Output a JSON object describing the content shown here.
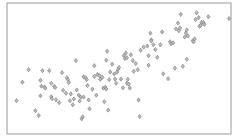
{
  "chart_data": {
    "type": "scatter",
    "title": "",
    "xlabel": "",
    "ylabel": "",
    "xlim": [
      0,
      100
    ],
    "ylim": [
      0,
      100
    ],
    "grid": false,
    "legend": null,
    "marker": "diamond",
    "colors": {
      "marker_fill": "#b9b9b9",
      "marker_edge": "#7d7d7d",
      "frame": "#9a9a9a"
    },
    "points": [
      [
        3.4,
        24.7
      ],
      [
        6.1,
        39.2
      ],
      [
        8.9,
        49.1
      ],
      [
        12.0,
        16.8
      ],
      [
        13.5,
        13.0
      ],
      [
        14.3,
        40.7
      ],
      [
        14.7,
        36.1
      ],
      [
        14.3,
        28.5
      ],
      [
        15.2,
        48.3
      ],
      [
        16.1,
        35.4
      ],
      [
        16.5,
        34.6
      ],
      [
        18.3,
        48.3
      ],
      [
        19.2,
        38.4
      ],
      [
        19.2,
        27.7
      ],
      [
        19.6,
        26.2
      ],
      [
        20.5,
        35.9
      ],
      [
        21.0,
        35.1
      ],
      [
        21.4,
        25.4
      ],
      [
        22.8,
        23.1
      ],
      [
        24.1,
        46.8
      ],
      [
        24.6,
        32.8
      ],
      [
        25.9,
        30.5
      ],
      [
        26.3,
        42.7
      ],
      [
        26.8,
        41.2
      ],
      [
        27.2,
        38.9
      ],
      [
        27.7,
        24.6
      ],
      [
        28.1,
        30.0
      ],
      [
        29.0,
        21.4
      ],
      [
        29.5,
        26.0
      ],
      [
        30.4,
        56.2
      ],
      [
        30.8,
        33.1
      ],
      [
        31.7,
        29.0
      ],
      [
        32.1,
        24.4
      ],
      [
        32.6,
        27.5
      ],
      [
        33.0,
        10.4
      ],
      [
        33.5,
        11.9
      ],
      [
        33.9,
        43.5
      ],
      [
        33.9,
        27.5
      ],
      [
        34.8,
        42.7
      ],
      [
        35.3,
        41.2
      ],
      [
        35.7,
        36.6
      ],
      [
        36.2,
        25.2
      ],
      [
        36.6,
        18.3
      ],
      [
        37.9,
        33.7
      ],
      [
        38.8,
        52.2
      ],
      [
        38.8,
        43.8
      ],
      [
        39.7,
        29.0
      ],
      [
        40.2,
        45.3
      ],
      [
        41.1,
        44.5
      ],
      [
        41.5,
        41.5
      ],
      [
        42.4,
        43.0
      ],
      [
        42.9,
        34.6
      ],
      [
        43.3,
        23.9
      ],
      [
        43.8,
        35.4
      ],
      [
        44.2,
        33.8
      ],
      [
        44.2,
        56.5
      ],
      [
        44.6,
        63.6
      ],
      [
        45.1,
        17.3
      ],
      [
        45.5,
        41.2
      ],
      [
        46.0,
        47.3
      ],
      [
        46.9,
        53.4
      ],
      [
        47.8,
        45.7
      ],
      [
        48.2,
        41.7
      ],
      [
        48.7,
        38.4
      ],
      [
        49.1,
        47.1
      ],
      [
        49.6,
        49.4
      ],
      [
        50.0,
        50.9
      ],
      [
        50.9,
        41.7
      ],
      [
        51.8,
        34.8
      ],
      [
        52.2,
        60.1
      ],
      [
        52.7,
        57.8
      ],
      [
        53.1,
        62.3
      ],
      [
        53.6,
        58.5
      ],
      [
        53.6,
        38.4
      ],
      [
        54.0,
        41.5
      ],
      [
        54.5,
        37.6
      ],
      [
        54.9,
        34.6
      ],
      [
        55.4,
        60.8
      ],
      [
        56.3,
        56.2
      ],
      [
        56.7,
        47.8
      ],
      [
        57.6,
        53.9
      ],
      [
        58.5,
        49.1
      ],
      [
        58.9,
        25.2
      ],
      [
        59.4,
        12.2
      ],
      [
        59.8,
        64.4
      ],
      [
        61.2,
        66.9
      ],
      [
        62.9,
        67.7
      ],
      [
        63.4,
        60.1
      ],
      [
        63.4,
        52.5
      ],
      [
        64.3,
        77.8
      ],
      [
        64.7,
        72.5
      ],
      [
        64.7,
        71.8
      ],
      [
        65.6,
        68.7
      ],
      [
        66.5,
        64.9
      ],
      [
        67.4,
        58.8
      ],
      [
        68.8,
        68.7
      ],
      [
        69.6,
        78.8
      ],
      [
        70.1,
        45.8
      ],
      [
        72.3,
        42.0
      ],
      [
        73.2,
        71.0
      ],
      [
        73.7,
        69.5
      ],
      [
        74.6,
        70.2
      ],
      [
        75.4,
        50.2
      ],
      [
        75.9,
        81.2
      ],
      [
        76.8,
        85.8
      ],
      [
        77.2,
        79.7
      ],
      [
        77.7,
        82.0
      ],
      [
        78.1,
        92.6
      ],
      [
        79.0,
        51.7
      ],
      [
        79.9,
        74.8
      ],
      [
        80.4,
        77.9
      ],
      [
        80.8,
        57.3
      ],
      [
        80.8,
        80.4
      ],
      [
        81.3,
        75.6
      ],
      [
        83.5,
        71.8
      ],
      [
        83.9,
        71.0
      ],
      [
        84.4,
        73.3
      ],
      [
        84.8,
        88.5
      ],
      [
        85.3,
        93.9
      ],
      [
        86.2,
        90.1
      ],
      [
        86.6,
        83.2
      ],
      [
        87.1,
        84.0
      ],
      [
        87.5,
        86.3
      ],
      [
        88.4,
        86.3
      ],
      [
        88.8,
        84.7
      ],
      [
        90.6,
        90.8
      ],
      [
        100.0,
        89.3
      ]
    ]
  }
}
